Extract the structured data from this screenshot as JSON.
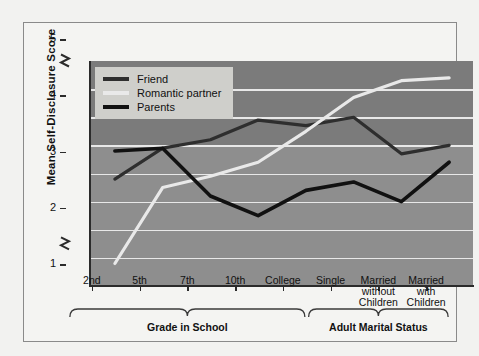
{
  "chart_data": {
    "type": "line",
    "title": "",
    "xlabel": "",
    "ylabel": "Mean Self-Disclosure Score",
    "ylim": [
      1,
      5
    ],
    "yticks": [
      1,
      2,
      3,
      4,
      5
    ],
    "ytick_labels": [
      "1",
      "2",
      "3",
      "4",
      "5"
    ],
    "y_axis_break": true,
    "grid": true,
    "grid_orientation": "horizontal",
    "legend_position": "top-left",
    "categories": [
      "2nd",
      "5th",
      "7th",
      "10th",
      "College",
      "Single",
      "Married without Children",
      "Married with Children"
    ],
    "tick_labels": [
      "2nd",
      "5th",
      "7th",
      "10th",
      "College",
      "Single",
      "Married\nwithout\nChildren",
      "Married\nwith\nChildren"
    ],
    "series": [
      {
        "name": "Friend",
        "color": "#2e2e2e",
        "values": [
          2.9,
          3.45,
          3.6,
          3.95,
          3.85,
          4.0,
          3.35,
          3.5
        ]
      },
      {
        "name": "Romantic partner",
        "color": "#e9e9e9",
        "values": [
          1.4,
          2.75,
          2.95,
          3.2,
          3.75,
          4.35,
          4.65,
          4.7
        ]
      },
      {
        "name": "Parents",
        "color": "#111111",
        "values": [
          3.4,
          3.45,
          2.6,
          2.25,
          2.7,
          2.85,
          2.5,
          3.2
        ]
      }
    ],
    "groups": [
      {
        "label": "Grade in School",
        "from": 0,
        "to": 4
      },
      {
        "label": "Adult Marital Status",
        "from": 5,
        "to": 7
      }
    ]
  },
  "legend": {
    "items": [
      {
        "label": "Friend"
      },
      {
        "label": "Romantic partner"
      },
      {
        "label": "Parents"
      }
    ]
  }
}
